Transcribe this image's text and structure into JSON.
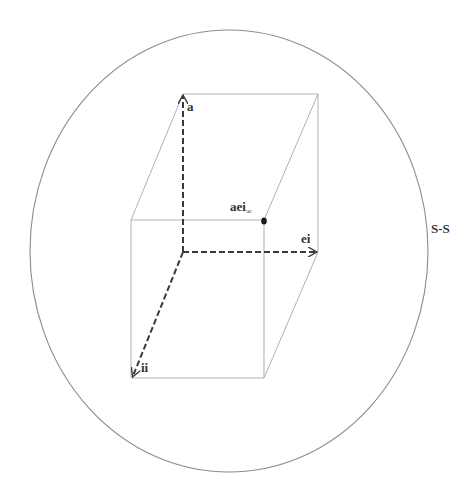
{
  "diagram": {
    "type": "3d-vector-cube-in-sphere",
    "colors": {
      "outline": "#8c8c8c",
      "box_edge": "#a8a8a8",
      "vector": "#3a3a3a",
      "point": "#1a1a1a",
      "label": "#333333"
    },
    "boundary": {
      "label": "S-S",
      "shape": "ellipse"
    },
    "axes": [
      {
        "id": "a",
        "label": "a",
        "direction": "up"
      },
      {
        "id": "ei",
        "label": "ei",
        "direction": "right"
      },
      {
        "id": "ii",
        "label": "ii",
        "direction": "down-left"
      }
    ],
    "point": {
      "label_main": "aei",
      "label_sub": "∞"
    }
  }
}
